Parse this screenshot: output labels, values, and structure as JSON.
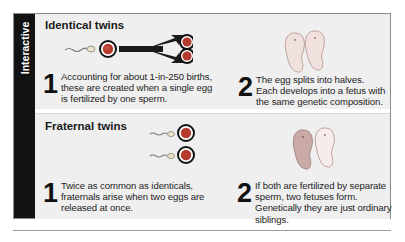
{
  "sidebar": {
    "label": "Interactive"
  },
  "panels": [
    {
      "title": "Identical twins",
      "steps": [
        {
          "number": "1",
          "text": "Accounting for about 1-in-250 births, these are created when a single egg is fertilized by one sperm."
        },
        {
          "number": "2",
          "text": "The egg splits into halves. Each develops into a fetus with the same genetic composition."
        }
      ],
      "illustrations": [
        "sperm-icon",
        "egg-icon",
        "split-arrow-icon",
        "split-egg-icon",
        "twin-fetuses-icon"
      ]
    },
    {
      "title": "Fraternal twins",
      "steps": [
        {
          "number": "1",
          "text": "Twice as common as identicals, fraternals arise when two eggs are released at once."
        },
        {
          "number": "2",
          "text": "If both are fertilized by separate sperm, two fetuses form. Genetically they are just ordinary siblings."
        }
      ],
      "illustrations": [
        "sperm-icon",
        "egg-icon",
        "sperm-icon",
        "egg-icon",
        "twin-fetuses-icon"
      ]
    }
  ],
  "colors": {
    "sidebar": "#121212",
    "panel_bg": "#efefef",
    "egg_ring": "#1a1a1a",
    "egg_core": "#c0392b",
    "fetus": "#f3e2e0",
    "fetus_dark": "#c9aaa6"
  }
}
